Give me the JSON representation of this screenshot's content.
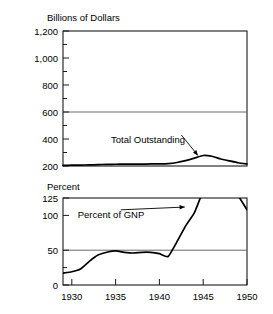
{
  "chart_data": [
    {
      "type": "line",
      "panel": "top",
      "title": "",
      "ylabel": "Billions of Dollars",
      "xlabel": "",
      "ylim": [
        200,
        1200
      ],
      "xlim": [
        1929,
        1950
      ],
      "yticks": [
        200,
        400,
        600,
        800,
        1000,
        1200
      ],
      "ytick_labels": [
        "200",
        "400",
        "600",
        "800",
        "1,000",
        "1,200"
      ],
      "yminor": [
        300,
        500,
        700,
        900,
        1100
      ],
      "xticks": [
        1930,
        1935,
        1940,
        1945,
        1950
      ],
      "xtick_labels": [
        "1930",
        "1935",
        "1940",
        "1945",
        "1950"
      ],
      "grid": false,
      "reference_lines": [
        600
      ],
      "legend": "none",
      "annotations": [
        {
          "text": "Total Outstanding",
          "x": 1942.5,
          "y": 430,
          "arrow_to_x": 1944.4,
          "arrow_to_y": 278
        }
      ],
      "series": [
        {
          "name": "Total Outstanding",
          "x": [
            1929,
            1930,
            1931,
            1932,
            1933,
            1934,
            1935,
            1936,
            1937,
            1938,
            1939,
            1940,
            1941,
            1942,
            1943,
            1944,
            1945,
            1946,
            1947,
            1948,
            1949,
            1950
          ],
          "values": [
            205,
            206,
            207,
            208,
            210,
            212,
            213,
            214,
            214,
            214,
            215,
            216,
            218,
            226,
            240,
            258,
            278,
            272,
            252,
            238,
            224,
            215
          ]
        }
      ]
    },
    {
      "type": "line",
      "panel": "bottom",
      "title": "",
      "ylabel": "Percent",
      "xlabel": "",
      "ylim": [
        0,
        125
      ],
      "xlim": [
        1929,
        1950
      ],
      "yticks": [
        0,
        50,
        100,
        125
      ],
      "ytick_labels": [
        "0",
        "50",
        "100",
        "125"
      ],
      "yminor": [
        25
      ],
      "xticks": [
        1930,
        1935,
        1940,
        1945,
        1950
      ],
      "xtick_labels": [
        "1930",
        "1935",
        "1940",
        "1945",
        "1950"
      ],
      "grid": false,
      "reference_lines": [
        50
      ],
      "legend": "none",
      "clipped_above": true,
      "annotations": [
        {
          "text": "Percent of GNP",
          "x": 1935.6,
          "y": 108,
          "arrow_to_x": 1942.9,
          "arrow_to_y": 112
        }
      ],
      "series": [
        {
          "name": "Percent of GNP",
          "x": [
            1929,
            1930,
            1931,
            1932,
            1933,
            1934,
            1935,
            1936,
            1937,
            1938,
            1939,
            1940,
            1941,
            1942,
            1943,
            1944,
            1945,
            1946,
            1947,
            1948,
            1949,
            1950
          ],
          "values": [
            17,
            19,
            23,
            34,
            43,
            47,
            49,
            47,
            46,
            47,
            47,
            45,
            41,
            62,
            85,
            104,
            135,
            150,
            148,
            140,
            128,
            108
          ]
        }
      ]
    }
  ],
  "labels": {
    "top_axis_title": "Billions of Dollars",
    "bottom_axis_title": "Percent",
    "top_annotation": "Total Outstanding",
    "bottom_annotation": "Percent of GNP",
    "top_y_1200": "1,200",
    "top_y_1000": "1,000",
    "top_y_800": "800",
    "top_y_600": "600",
    "top_y_400": "400",
    "top_y_200": "200",
    "bot_y_125": "125",
    "bot_y_100": "100",
    "bot_y_50": "50",
    "bot_y_0": "0",
    "x_1930": "1930",
    "x_1935": "1935",
    "x_1940": "1940",
    "x_1945": "1945",
    "x_1950": "1950"
  },
  "colors": {
    "line": "#000000",
    "frame": "#1a1a1a",
    "reference": "#6b6b6b",
    "background": "#ffffff"
  }
}
